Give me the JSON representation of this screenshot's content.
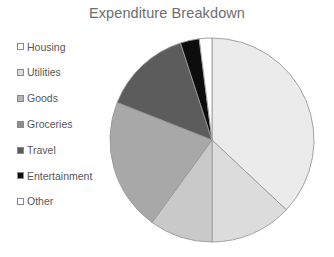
{
  "chart_data": {
    "type": "pie",
    "title": "Expenditure Breakdown",
    "xlabel": "",
    "ylabel": "",
    "legend_position": "left",
    "grid": false,
    "start_angle_deg": 0,
    "direction": "clockwise",
    "categories": [
      "Housing",
      "Utilities",
      "Goods",
      "Groceries",
      "Travel",
      "Entertainment",
      "Other"
    ],
    "values": [
      37,
      13,
      10,
      21,
      14,
      3,
      2
    ],
    "slices": [
      {
        "label": "Housing",
        "value": 37,
        "color": "#ebebeb"
      },
      {
        "label": "Utilities",
        "value": 13,
        "color": "#dcdcdc"
      },
      {
        "label": "Goods",
        "value": 10,
        "color": "#c9c9c9"
      },
      {
        "label": "Groceries",
        "value": 21,
        "color": "#a8a8a8"
      },
      {
        "label": "Travel",
        "value": 14,
        "color": "#5c5c5c"
      },
      {
        "label": "Entertainment",
        "value": 3,
        "color": "#0d0d0d"
      },
      {
        "label": "Other",
        "value": 2,
        "color": "#ffffff"
      }
    ]
  },
  "legend": {
    "items": [
      {
        "label": "Housing",
        "color": "#fbfbfb"
      },
      {
        "label": "Utilities",
        "color": "#dcdcdc"
      },
      {
        "label": "Goods",
        "color": "#b4b4b4"
      },
      {
        "label": "Groceries",
        "color": "#8f8f8f"
      },
      {
        "label": "Travel",
        "color": "#5c5c5c"
      },
      {
        "label": "Entertainment",
        "color": "#0d0d0d"
      },
      {
        "label": "Other",
        "color": "#ffffff"
      }
    ]
  },
  "colors": {
    "background": "#ffffff",
    "title_text": "#6e6e6e",
    "legend_text": "#58585a",
    "slice_outline": "#9a9a9a",
    "swatch_outline": "#8a8a8a"
  }
}
